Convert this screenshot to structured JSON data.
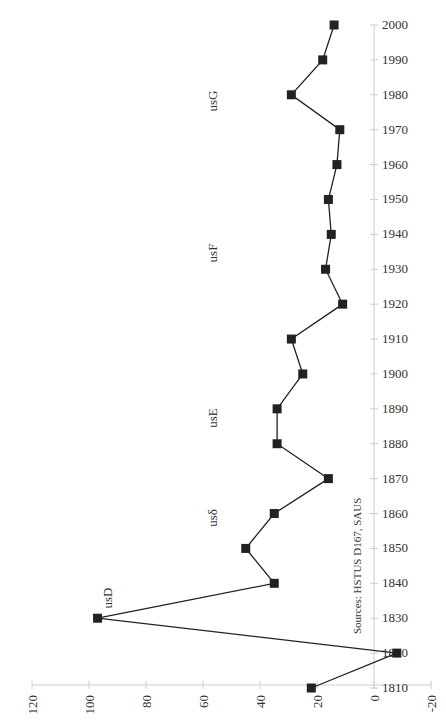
{
  "chart_data": {
    "type": "line",
    "orientation": "rotated-90",
    "title": "",
    "xlabel": "",
    "ylabel": "",
    "x": [
      1810,
      1820,
      1830,
      1840,
      1850,
      1860,
      1870,
      1880,
      1890,
      1900,
      1910,
      1920,
      1930,
      1940,
      1950,
      1960,
      1970,
      1980,
      1990,
      2000
    ],
    "series": [
      {
        "name": "series",
        "values": [
          22,
          -8,
          97,
          35,
          45,
          35,
          16,
          34,
          34,
          25,
          29,
          11,
          17,
          15,
          16,
          13,
          12,
          29,
          18,
          14
        ],
        "marker": "square",
        "color": "#222222"
      }
    ],
    "xlim": [
      1810,
      2000
    ],
    "ylim": [
      -20,
      120
    ],
    "value_ticks": [
      "120",
      "100",
      "80",
      "60",
      "40",
      "20",
      "0",
      "-20"
    ],
    "year_ticks": [
      "1810",
      "1820",
      "1830",
      "1840",
      "1850",
      "1860",
      "1870",
      "1880",
      "1890",
      "1900",
      "1910",
      "1920",
      "1930",
      "1940",
      "1950",
      "1960",
      "1970",
      "1980",
      "1990",
      "2000"
    ],
    "annotations": [
      {
        "text": "usD",
        "near_year": 1830
      },
      {
        "text": "usδ",
        "near_year": 1855
      },
      {
        "text": "usE",
        "near_year": 1890
      },
      {
        "text": "usF",
        "near_year": 1935
      },
      {
        "text": "usG",
        "near_year": 1980
      }
    ],
    "source_note": "Sources: HSTUS D167, SAUS",
    "grid": false,
    "legend": "none"
  }
}
